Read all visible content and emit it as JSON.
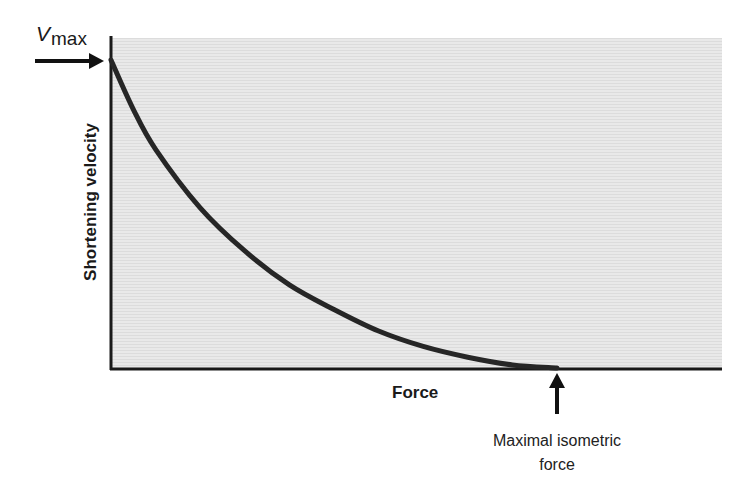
{
  "chart_data": {
    "type": "line",
    "title": "",
    "xlabel": "Force",
    "ylabel": "Shortening velocity",
    "x_ticks": [],
    "y_ticks": [],
    "grid": false,
    "legend": null,
    "xlim": [
      0,
      1.37
    ],
    "ylim": [
      0,
      1.09
    ],
    "series": [
      {
        "name": "Force-velocity curve",
        "x": [
          0.0,
          0.05,
          0.1,
          0.2,
          0.3,
          0.4,
          0.5,
          0.6,
          0.7,
          0.8,
          0.9,
          1.0
        ],
        "y": [
          1.0,
          0.84,
          0.71,
          0.52,
          0.38,
          0.27,
          0.19,
          0.12,
          0.07,
          0.035,
          0.01,
          0.0
        ]
      }
    ],
    "annotations": [
      {
        "text": "V max",
        "points_to": "y-axis intercept (maximal shortening velocity)",
        "x": 0.0,
        "y": 1.0,
        "arrow": "right"
      },
      {
        "text": "Maximal isometric force",
        "points_to": "x-axis intercept",
        "x": 1.0,
        "y": 0.0,
        "arrow": "up"
      }
    ],
    "background": "#e6e6e6",
    "line_color": "#262626"
  },
  "labels": {
    "vmax_main": "V",
    "vmax_sub": "max",
    "y_axis": "Shortening velocity",
    "x_axis": "Force",
    "annotation_line1": "Maximal isometric",
    "annotation_line2": "force"
  }
}
